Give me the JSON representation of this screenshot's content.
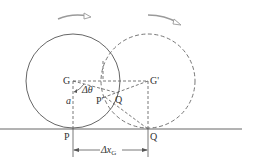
{
  "diagram": {
    "colors": {
      "line": "#555555",
      "arrow": "#9a9a9a",
      "background": "#ffffff"
    },
    "circle_initial": {
      "cx": 73,
      "cy": 81,
      "r": 47,
      "style": "solid"
    },
    "circle_final": {
      "cx": 148,
      "cy": 81,
      "r": 47,
      "style": "dashed"
    },
    "ground": {
      "y": 129,
      "x1": 0,
      "x2": 242
    },
    "labels": {
      "G": "G",
      "G_prime": "G'",
      "P_ground": "P",
      "Q_ground": "Q",
      "P_prime": "P'",
      "Q_point": "Q",
      "a": "a",
      "delta_theta": "Δθ",
      "delta_x": "Δx",
      "delta_x_sub": "G"
    },
    "arrows": [
      {
        "name": "rotation-arrow-left",
        "direction": "clockwise"
      },
      {
        "name": "rotation-arrow-right",
        "direction": "clockwise"
      }
    ]
  }
}
